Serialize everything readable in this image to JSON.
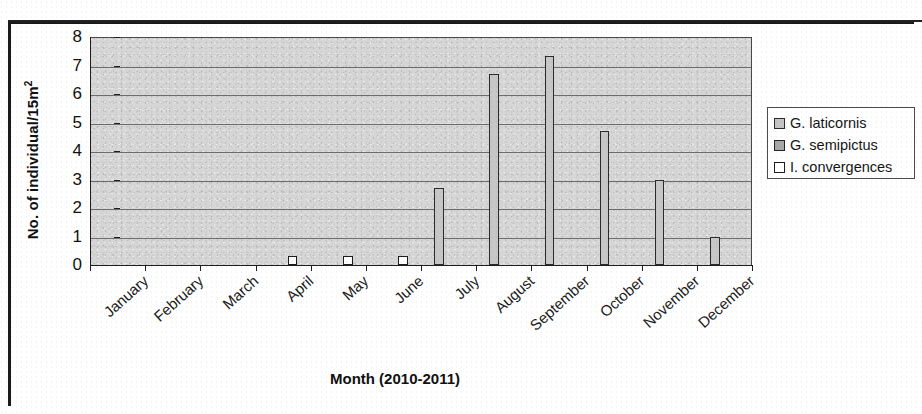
{
  "chart_data": {
    "type": "bar",
    "title": "",
    "xlabel": "Month (2010-2011)",
    "ylabel": "No. of individual/15m",
    "ylabel_sup": "2",
    "categories": [
      "January",
      "February",
      "March",
      "April",
      "May",
      "June",
      "July",
      "August",
      "September",
      "October",
      "November",
      "December"
    ],
    "ylim": [
      0,
      8
    ],
    "yticks": [
      "0",
      "1",
      "2",
      "3",
      "4",
      "5",
      "6",
      "7",
      "8"
    ],
    "grid": true,
    "legend_position": "right",
    "series": [
      {
        "name": "G. laticornis",
        "color": "#c7c7c7",
        "values": [
          0,
          0,
          0,
          0,
          0,
          0,
          2.7,
          6.7,
          7.35,
          4.7,
          3.0,
          1.0
        ]
      },
      {
        "name": "G. semipictus",
        "color": "#b0b0b0",
        "values": [
          0,
          0,
          0,
          0,
          0,
          0,
          0,
          0,
          0,
          0,
          0,
          0
        ]
      },
      {
        "name": "I. convergences",
        "color": "#ffffff",
        "values": [
          0,
          0,
          0,
          0.3,
          0.3,
          0.3,
          0,
          0,
          0,
          0,
          0,
          0
        ]
      }
    ]
  },
  "legend": {
    "items": [
      {
        "label": "G. laticornis",
        "swatch": "sw-laticornis"
      },
      {
        "label": "G. semipictus",
        "swatch": "sw-semipictus"
      },
      {
        "label": "I. convergences",
        "swatch": "sw-convergences"
      }
    ]
  },
  "colors": {
    "plot_background": "#d6d6d6",
    "gridline": "#6d6d6d",
    "axis": "#1f1f1f",
    "text": "#111111"
  }
}
